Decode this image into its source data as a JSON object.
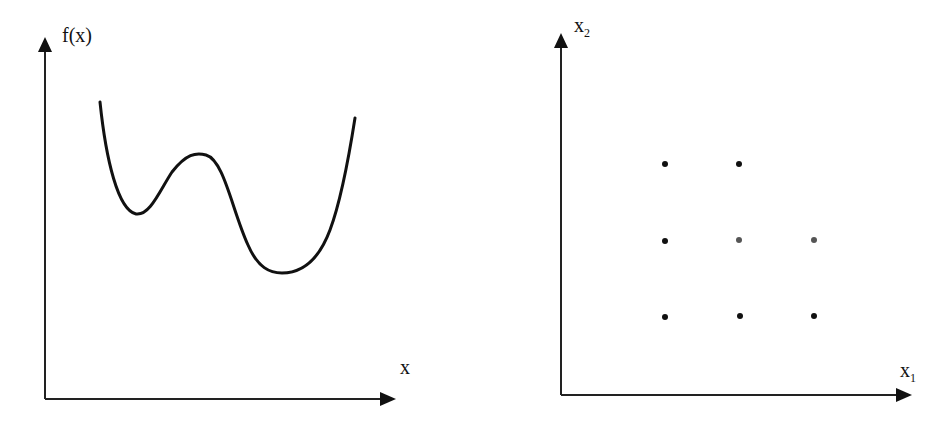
{
  "panels": [
    {
      "id": "function-plot",
      "y_label": "f(x)",
      "x_label": "x",
      "curve": "M100,102 C106,160 118,210 136,214 C150,216 160,190 172,172 C186,154 196,152 206,155 C224,160 232,210 248,245 C258,268 270,273 282,273 C300,273 318,262 330,230 C342,198 350,150 355,118"
    },
    {
      "id": "grid-points",
      "y_label": "x",
      "y_sub": "2",
      "x_label": "x",
      "x_sub": "1",
      "points": [
        {
          "x": 665,
          "y": 164
        },
        {
          "x": 739,
          "y": 164
        },
        {
          "x": 665,
          "y": 241
        },
        {
          "x": 739,
          "y": 240
        },
        {
          "x": 814,
          "y": 240
        },
        {
          "x": 665,
          "y": 317
        },
        {
          "x": 740,
          "y": 316
        },
        {
          "x": 814,
          "y": 316
        }
      ]
    }
  ],
  "colors": {
    "ink": "#111111",
    "point_light": "#555555"
  }
}
